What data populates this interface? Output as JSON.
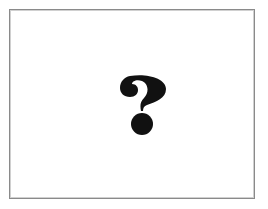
{
  "placeholder": {
    "icon": "question-mark-icon",
    "icon_color": "#111111",
    "border_color": "#8a8a8a",
    "background": "#ffffff"
  }
}
